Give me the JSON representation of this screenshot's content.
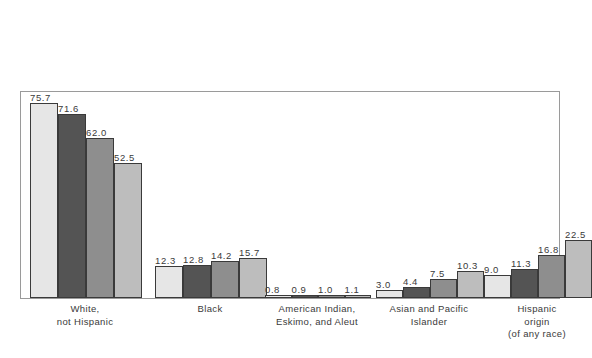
{
  "header": {
    "subtitle": "(Middle-series projections)"
  },
  "legend": {
    "items": [
      {
        "label": "1990",
        "color": "#e6e6e6"
      },
      {
        "label": "2000",
        "color": "#545454"
      },
      {
        "label": "2025",
        "color": "#8e8e8e"
      },
      {
        "label": "2050",
        "color": "#bdbdbd"
      }
    ]
  },
  "chart_data": {
    "type": "bar",
    "subtitle": "(Middle-series projections)",
    "xlabel": "",
    "ylabel": "",
    "ylim": [
      0,
      80
    ],
    "grid": false,
    "legend_position": "top-right",
    "categories": [
      "White,\nnot Hispanic",
      "Black",
      "American Indian,\nEskimo, and Aleut",
      "Asian and Pacific\nIslander",
      "Hispanic\norigin\n(of any race)"
    ],
    "series": [
      {
        "name": "1990",
        "color": "#e6e6e6",
        "values": [
          75.7,
          12.3,
          0.8,
          3.0,
          9.0
        ]
      },
      {
        "name": "2000",
        "color": "#545454",
        "values": [
          71.6,
          12.8,
          0.9,
          4.4,
          11.3
        ]
      },
      {
        "name": "2025",
        "color": "#8e8e8e",
        "values": [
          62.0,
          14.2,
          1.0,
          7.5,
          16.8
        ]
      },
      {
        "name": "2050",
        "color": "#bdbdbd",
        "values": [
          52.5,
          15.7,
          1.1,
          10.3,
          22.5
        ]
      }
    ],
    "value_labels": [
      [
        "75.7",
        "71.6",
        "62.0",
        "52.5"
      ],
      [
        "12.3",
        "12.8",
        "14.2",
        "15.7"
      ],
      [
        "0.8",
        "0.9",
        "1.0",
        "1.1"
      ],
      [
        "3.0",
        "4.4",
        "7.5",
        "10.3"
      ],
      [
        "9.0",
        "11.3",
        "16.8",
        "22.5"
      ]
    ]
  }
}
